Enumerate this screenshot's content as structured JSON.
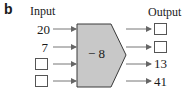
{
  "figure_label": "b",
  "input_header": "Input",
  "output_header": "Output",
  "machine": {
    "operation": "− 8",
    "fill": "#c8c8c8",
    "stroke": "#3a3a3a"
  },
  "inputs": [
    "20",
    "7",
    "",
    ""
  ],
  "outputs": [
    "",
    "",
    "13",
    "41"
  ]
}
